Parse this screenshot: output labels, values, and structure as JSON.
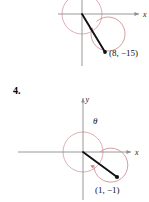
{
  "page": {
    "problem_number": "4.",
    "background_color": "#ffffff"
  },
  "colors": {
    "axis": "#8c8c8c",
    "circle": "#d49aa0",
    "arc": "#c8858c",
    "ray": "#111111",
    "text": "#111111"
  },
  "figures": [
    {
      "id": "figure-top",
      "description": "angle in standard position, terminal side through (8, -15)",
      "axes": {
        "x_label": "x",
        "y_label": "",
        "origin": {
          "x": 82,
          "y": 14
        }
      },
      "unit_circle": {
        "radius": 20
      },
      "angle": {
        "label": "",
        "direction": "clockwise"
      },
      "terminal_point": {
        "label": "(8,  −15)",
        "x": 8,
        "y": -15,
        "dot": {
          "x": 105,
          "y": 52
        }
      }
    },
    {
      "id": "figure-bottom",
      "description": "angle theta in standard position, terminal side through (1, -1)",
      "axes": {
        "x_label": "x",
        "y_label": "y",
        "origin": {
          "x": 83,
          "y": 60
        }
      },
      "unit_circle": {
        "radius": 20
      },
      "angle": {
        "label": "θ",
        "direction": "clockwise"
      },
      "terminal_point": {
        "label": "(1,  −1)",
        "x": 1,
        "y": -1,
        "dot": {
          "x": 117,
          "y": 85
        }
      }
    }
  ]
}
